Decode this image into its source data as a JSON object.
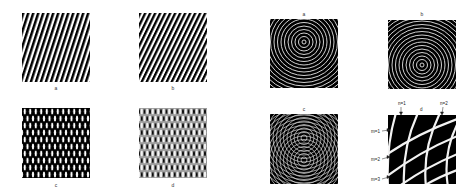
{
  "left_figure": {
    "panels": [
      {
        "id": "a",
        "label": "a",
        "pattern": "diagonal-stripes-right",
        "description": "linear grating tilted right"
      },
      {
        "id": "b",
        "label": "b",
        "pattern": "diagonal-stripes-left",
        "description": "linear grating tilted left"
      },
      {
        "id": "c",
        "label": "c",
        "pattern": "moire-dark",
        "description": "product moire of gratings a and b"
      },
      {
        "id": "d",
        "label": "d",
        "pattern": "moire-gray",
        "description": "sum moire of gratings a and b"
      }
    ]
  },
  "right_figure": {
    "panels": [
      {
        "id": "a",
        "label": "a",
        "pattern": "concentric-rings-top",
        "description": "concentric rings centered upper"
      },
      {
        "id": "b",
        "label": "b",
        "pattern": "concentric-rings-bottom",
        "description": "concentric rings centered lower"
      },
      {
        "id": "c",
        "label": "c",
        "pattern": "ring-superposition",
        "description": "overlap of two ring systems"
      },
      {
        "id": "d",
        "label": "d",
        "pattern": "moire-fringes",
        "description": "enlarged moire fringe detail"
      }
    ],
    "annotations": {
      "n1": "n=1",
      "n2": "n=2",
      "m1": "m=1",
      "m2": "m=2",
      "m3": "m=3"
    }
  },
  "colors": {
    "ink": "#000000",
    "paper": "#ffffff",
    "label": "#333333"
  }
}
